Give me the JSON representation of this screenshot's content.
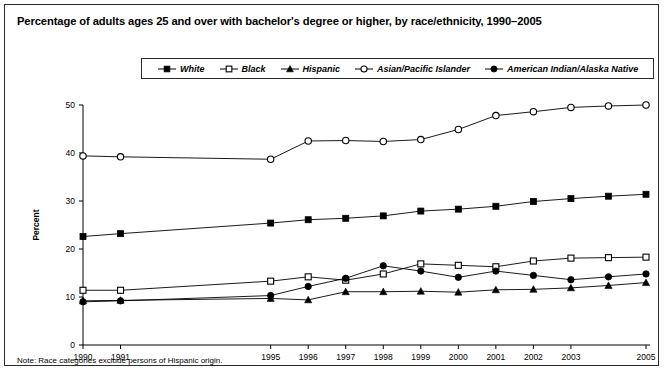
{
  "title": "Percentage of adults ages 25 and over with bachelor's degree or higher, by race/ethnicity, 1990–2005",
  "note": "Note: Race categories exclude persons of Hispanic origin.",
  "axis": {
    "ylabel": "Percent",
    "ylim": [
      0,
      50
    ],
    "yticks": [
      "0",
      "10",
      "20",
      "30",
      "40",
      "50"
    ],
    "xticks": [
      "1990",
      "1991",
      "1995",
      "1996",
      "1997",
      "1998",
      "1999",
      "2000",
      "2001",
      "2002",
      "2003",
      "2005"
    ]
  },
  "legend": [
    {
      "label": "White",
      "marker": "filled-square"
    },
    {
      "label": "Black",
      "marker": "open-square"
    },
    {
      "label": "Hispanic",
      "marker": "filled-triangle"
    },
    {
      "label": "Asian/Pacific Islander",
      "marker": "open-circle"
    },
    {
      "label": "American Indian/Alaska Native",
      "marker": "filled-circle"
    }
  ],
  "chart_data": {
    "type": "line",
    "title": "Percentage of adults ages 25 and over with bachelor's degree or higher, by race/ethnicity, 1990–2005",
    "xlabel": "",
    "ylabel": "Percent",
    "ylim": [
      0,
      50
    ],
    "yticks": [
      0,
      10,
      20,
      30,
      40,
      50
    ],
    "grid": false,
    "legend_position": "top-center",
    "x": [
      1990,
      1991,
      1995,
      1996,
      1997,
      1998,
      1999,
      2000,
      2001,
      2002,
      2003,
      2004,
      2005
    ],
    "xtick_labels": [
      "1990",
      "1991",
      "1995",
      "1996",
      "1997",
      "1998",
      "1999",
      "2000",
      "2001",
      "2002",
      "2003",
      "",
      "2005"
    ],
    "note": "Note: Race categories exclude persons of Hispanic origin.",
    "series": [
      {
        "name": "White",
        "marker": "filled-square",
        "values": [
          22.6,
          23.2,
          25.4,
          26.1,
          26.4,
          26.9,
          27.9,
          28.3,
          28.9,
          29.9,
          30.5,
          31.0,
          31.4
        ]
      },
      {
        "name": "Black",
        "marker": "open-square",
        "values": [
          11.4,
          11.4,
          13.3,
          14.2,
          13.5,
          14.8,
          16.9,
          16.6,
          16.3,
          17.5,
          18.1,
          18.2,
          18.3
        ]
      },
      {
        "name": "Hispanic",
        "marker": "filled-triangle",
        "values": [
          9.2,
          9.3,
          9.7,
          9.4,
          11.1,
          11.1,
          11.2,
          11.0,
          11.5,
          11.6,
          11.9,
          12.4,
          13.0
        ]
      },
      {
        "name": "Asian/Pacific Islander",
        "marker": "open-circle",
        "values": [
          39.4,
          39.2,
          38.7,
          42.5,
          42.6,
          42.4,
          42.8,
          44.9,
          47.8,
          48.6,
          49.5,
          49.8,
          50.0
        ]
      },
      {
        "name": "American Indian/Alaska Native",
        "marker": "filled-circle",
        "values": [
          9.0,
          9.2,
          10.3,
          12.2,
          13.9,
          16.5,
          15.4,
          14.1,
          15.4,
          14.5,
          13.6,
          14.2,
          14.8
        ]
      }
    ]
  }
}
